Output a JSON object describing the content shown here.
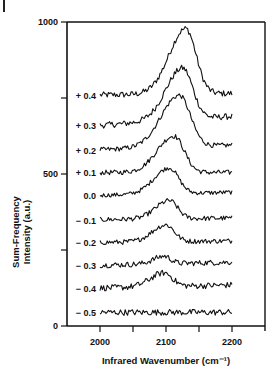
{
  "chart_data": {
    "type": "line",
    "title": "",
    "xlabel": "Infrared Wavenumber (cm⁻¹)",
    "ylabel_line1": "Sum-Frequency",
    "ylabel_line2": "Intensity (a.u.)",
    "xlim": [
      1950,
      2250
    ],
    "ylim": [
      0,
      1000
    ],
    "x_ticks": [
      2000,
      2050,
      2100,
      2150,
      2200
    ],
    "x_tick_labels": [
      "2000",
      "2100",
      "2200"
    ],
    "y_ticks": [
      0,
      250,
      500,
      750,
      1000
    ],
    "y_tick_labels": [
      "0",
      "500",
      "1000"
    ],
    "grid": false,
    "legend": "inline labels left of traces",
    "x_range_of_traces": [
      2000,
      2200
    ],
    "series": [
      {
        "name": "+ 0.4",
        "baseline": 760,
        "peak_x": 2130,
        "peak_y": 975,
        "width": 22,
        "end_level": 765,
        "noise": 10
      },
      {
        "name": "+ 0.3",
        "baseline": 660,
        "peak_x": 2125,
        "peak_y": 830,
        "width": 22,
        "end_level": 690,
        "noise": 10
      },
      {
        "name": "+ 0.2",
        "baseline": 580,
        "peak_x": 2120,
        "peak_y": 750,
        "width": 24,
        "end_level": 595,
        "noise": 8
      },
      {
        "name": "+ 0.1",
        "baseline": 505,
        "peak_x": 2112,
        "peak_y": 625,
        "width": 22,
        "end_level": 505,
        "noise": 8
      },
      {
        "name": "0.0",
        "baseline": 430,
        "peak_x": 2105,
        "peak_y": 515,
        "width": 20,
        "end_level": 440,
        "noise": 7
      },
      {
        "name": "− 0.1",
        "baseline": 350,
        "peak_x": 2105,
        "peak_y": 410,
        "width": 18,
        "end_level": 355,
        "noise": 8
      },
      {
        "name": "− 0.2",
        "baseline": 275,
        "peak_x": 2100,
        "peak_y": 330,
        "width": 18,
        "end_level": 280,
        "noise": 8
      },
      {
        "name": "− 0.3",
        "baseline": 200,
        "peak_x": 2097,
        "peak_y": 225,
        "width": 14,
        "end_level": 210,
        "noise": 9
      },
      {
        "name": "− 0.4",
        "baseline": 125,
        "peak_x": 2097,
        "peak_y": 170,
        "width": 18,
        "end_level": 135,
        "noise": 10
      },
      {
        "name": "− 0.5",
        "baseline": 45,
        "peak_x": 2100,
        "peak_y": 45,
        "width": 20,
        "end_level": 45,
        "noise": 10
      }
    ]
  },
  "colors": {
    "line": "#111111",
    "axis": "#111111",
    "background": "#ffffff"
  }
}
